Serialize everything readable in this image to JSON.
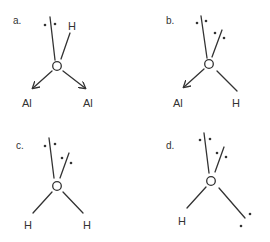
{
  "diagram": {
    "panels": [
      {
        "id": "a",
        "label": "a.",
        "center_atom": "O",
        "substituents": [
          "H",
          "Al",
          "Al"
        ],
        "lone_pairs": 1,
        "al_bonds": "dative arrows"
      },
      {
        "id": "b",
        "label": "b.",
        "center_atom": "O",
        "substituents": [
          "Al",
          "H"
        ],
        "lone_pairs": 2,
        "al_bonds": "dative arrow"
      },
      {
        "id": "c",
        "label": "c.",
        "center_atom": "O",
        "substituents": [
          "H",
          "H"
        ],
        "lone_pairs": 2
      },
      {
        "id": "d",
        "label": "d.",
        "center_atom": "O",
        "substituents": [
          "H"
        ],
        "lone_pairs": 3
      }
    ]
  },
  "labels": {
    "a": {
      "panel": "a.",
      "center": "O",
      "h": "H",
      "al1": "Al",
      "al2": "Al"
    },
    "b": {
      "panel": "b.",
      "center": "O",
      "al": "Al",
      "h": "H"
    },
    "c": {
      "panel": "c.",
      "center": "O",
      "h1": "H",
      "h2": "H"
    },
    "d": {
      "panel": "d.",
      "center": "O",
      "h": "H"
    }
  }
}
